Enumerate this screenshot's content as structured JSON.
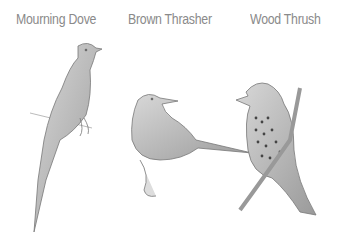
{
  "labels": [
    "Mourning Dove",
    "Brown Thrasher",
    "Wood Thrush"
  ],
  "illustration": {
    "style": "pencil sketch",
    "birds": [
      {
        "name": "Mourning Dove",
        "icon": "dove-sketch"
      },
      {
        "name": "Brown Thrasher",
        "icon": "thrasher-sketch"
      },
      {
        "name": "Wood Thrush",
        "icon": "thrush-sketch"
      }
    ]
  }
}
